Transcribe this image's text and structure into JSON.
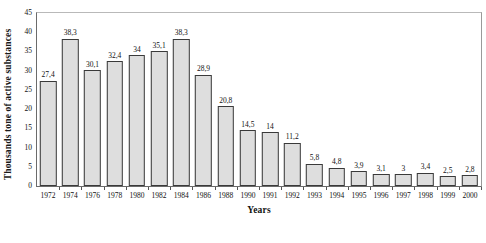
{
  "chart_data": {
    "type": "bar",
    "title": "",
    "xlabel": "Years",
    "ylabel": "Thousands tone of active substances",
    "ylim": [
      0,
      45
    ],
    "ytick_step": 5,
    "yticks": [
      "0",
      "5",
      "10",
      "15",
      "20",
      "25",
      "30",
      "35",
      "40",
      "45"
    ],
    "grid": false,
    "legend": null,
    "decimal_separator": ",",
    "bar_fill_color": "#dedede",
    "bar_border_color": "#3a3a3a",
    "categories": [
      "1972",
      "1974",
      "1976",
      "1978",
      "1980",
      "1982",
      "1984",
      "1986",
      "1988",
      "1990",
      "1991",
      "1992",
      "1993",
      "1994",
      "1995",
      "1996",
      "1997",
      "1998",
      "1999",
      "2000"
    ],
    "values": [
      27.4,
      38.3,
      30.1,
      32.4,
      34,
      35.1,
      38.3,
      28.9,
      20.8,
      14.5,
      14,
      11.2,
      5.8,
      4.8,
      3.9,
      3.1,
      3,
      3.4,
      2.5,
      2.8
    ],
    "value_labels": [
      "27,4",
      "38,3",
      "30,1",
      "32,4",
      "34",
      "35,1",
      "38,3",
      "28,9",
      "20,8",
      "14,5",
      "14",
      "11,2",
      "5,8",
      "4,8",
      "3,9",
      "3,1",
      "3",
      "3,4",
      "2,5",
      "2,8"
    ]
  }
}
